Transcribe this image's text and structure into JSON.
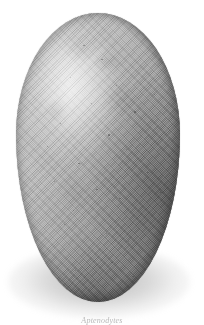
{
  "plate": {
    "background_color": "#ffffff",
    "width": 204,
    "height": 325,
    "subject": "egg",
    "caption": "Aptenodytes",
    "caption_color": "#b9b9b9"
  },
  "egg": {
    "label": "egg",
    "shell_color_light": "#d5d5d5",
    "shell_color_mid": "#9c9c9c",
    "shell_color_dark": "#767676",
    "rim_color": "#3c3c3c",
    "highlight_color": "#e8e8e8",
    "texture": "halftone-crosshatch",
    "light_direction": "upper-left"
  },
  "shadow": {
    "label": "cast-shadow",
    "color": "#787878"
  },
  "speckles": [
    {
      "x": 41,
      "y": 11,
      "size": 1.6
    },
    {
      "x": 52,
      "y": 16,
      "size": 1.3
    },
    {
      "x": 33,
      "y": 22,
      "size": 1.1
    },
    {
      "x": 61,
      "y": 25,
      "size": 1.4
    },
    {
      "x": 46,
      "y": 31,
      "size": 1.0
    },
    {
      "x": 72,
      "y": 34,
      "size": 1.7
    },
    {
      "x": 27,
      "y": 38,
      "size": 1.2
    },
    {
      "x": 56,
      "y": 42,
      "size": 2.0
    },
    {
      "x": 67,
      "y": 47,
      "size": 1.1
    },
    {
      "x": 38,
      "y": 52,
      "size": 1.3
    },
    {
      "x": 80,
      "y": 55,
      "size": 1.5
    },
    {
      "x": 23,
      "y": 58,
      "size": 1.0
    },
    {
      "x": 49,
      "y": 61,
      "size": 1.2
    },
    {
      "x": 63,
      "y": 64,
      "size": 1.8
    },
    {
      "x": 35,
      "y": 68,
      "size": 1.1
    },
    {
      "x": 75,
      "y": 70,
      "size": 1.3
    },
    {
      "x": 29,
      "y": 73,
      "size": 1.5
    },
    {
      "x": 55,
      "y": 76,
      "size": 1.0
    },
    {
      "x": 68,
      "y": 79,
      "size": 1.4
    },
    {
      "x": 44,
      "y": 82,
      "size": 1.2
    },
    {
      "x": 58,
      "y": 86,
      "size": 1.6
    },
    {
      "x": 36,
      "y": 89,
      "size": 1.0
    },
    {
      "x": 71,
      "y": 91,
      "size": 1.1
    },
    {
      "x": 50,
      "y": 94,
      "size": 1.3
    },
    {
      "x": 84,
      "y": 28,
      "size": 1.2
    },
    {
      "x": 19,
      "y": 46,
      "size": 1.0
    },
    {
      "x": 88,
      "y": 62,
      "size": 1.4
    }
  ]
}
